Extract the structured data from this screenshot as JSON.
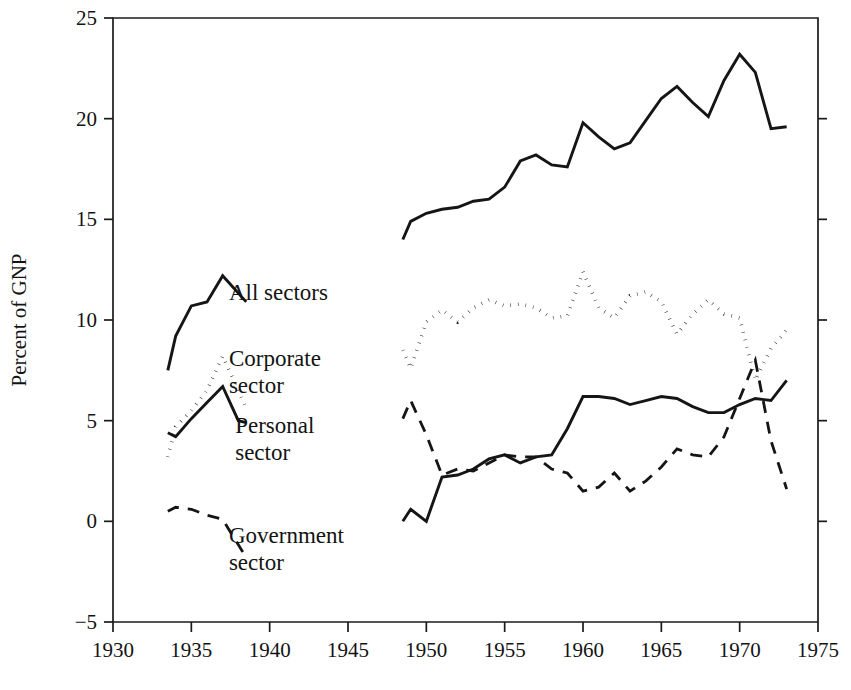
{
  "chart_data": {
    "type": "line",
    "title": "",
    "xlabel": "",
    "ylabel": "Percent of GNP",
    "xlim": [
      1930,
      1975
    ],
    "ylim": [
      -5,
      25
    ],
    "xticks": [
      1930,
      1935,
      1940,
      1945,
      1950,
      1955,
      1960,
      1965,
      1970,
      1975
    ],
    "xtick_labels": [
      "1930",
      "1935",
      "1940",
      "1945",
      "1950",
      "1955",
      "1960",
      "1965",
      "1970",
      "1975"
    ],
    "yticks": [
      -5,
      0,
      5,
      10,
      15,
      20,
      25
    ],
    "ytick_labels": [
      "−5",
      "0",
      "5",
      "10",
      "15",
      "20",
      "25"
    ],
    "grid": false,
    "legend_position": "inline-annotations",
    "series": [
      {
        "name": "All sectors",
        "style": "solid",
        "segments": [
          {
            "period": "prewar",
            "x": [
              1933.5,
              1934,
              1935,
              1936,
              1937,
              1938.5
            ],
            "values": [
              7.5,
              9.2,
              10.7,
              10.9,
              12.2,
              10.9
            ]
          },
          {
            "period": "postwar",
            "x": [
              1948.5,
              1949,
              1950,
              1951,
              1952,
              1953,
              1954,
              1955,
              1956,
              1957,
              1958,
              1959,
              1960,
              1961,
              1962,
              1963,
              1964,
              1965,
              1966,
              1967,
              1968,
              1969,
              1970,
              1971,
              1972,
              1973
            ],
            "values": [
              14.0,
              14.9,
              15.3,
              15.5,
              15.6,
              15.9,
              16.0,
              16.6,
              17.9,
              18.2,
              17.7,
              17.6,
              19.8,
              19.1,
              18.5,
              18.8,
              19.9,
              21.0,
              21.6,
              20.8,
              20.1,
              21.9,
              23.2,
              22.3,
              19.5,
              19.6
            ]
          }
        ]
      },
      {
        "name": "Corporate sector",
        "style": "dotted",
        "segments": [
          {
            "period": "prewar",
            "x": [
              1933.5,
              1934,
              1935,
              1936,
              1937,
              1938,
              1938.5
            ],
            "values": [
              3.2,
              4.7,
              5.5,
              6.5,
              8.2,
              6.5,
              5.6
            ]
          },
          {
            "period": "postwar",
            "x": [
              1948.5,
              1949,
              1950,
              1951,
              1952,
              1953,
              1954,
              1955,
              1956,
              1957,
              1958,
              1959,
              1960,
              1961,
              1962,
              1963,
              1964,
              1965,
              1966,
              1967,
              1968,
              1969,
              1970,
              1971,
              1972,
              1973
            ],
            "values": [
              8.5,
              7.6,
              9.9,
              10.5,
              9.9,
              10.6,
              11.0,
              10.7,
              10.8,
              10.6,
              10.1,
              10.2,
              12.4,
              10.6,
              10.1,
              11.2,
              11.4,
              10.9,
              9.3,
              10.3,
              11.0,
              10.3,
              10.1,
              7.0,
              8.6,
              9.5
            ]
          }
        ]
      },
      {
        "name": "Personal sector",
        "style": "solid",
        "segments": [
          {
            "period": "prewar",
            "x": [
              1933.5,
              1934,
              1935,
              1936,
              1937,
              1938,
              1938.5
            ],
            "values": [
              4.4,
              4.2,
              5.1,
              5.9,
              6.7,
              5.0,
              4.9
            ]
          },
          {
            "period": "postwar",
            "x": [
              1948.5,
              1949,
              1950,
              1951,
              1952,
              1953,
              1954,
              1955,
              1956,
              1957,
              1958,
              1959,
              1960,
              1961,
              1962,
              1963,
              1964,
              1965,
              1966,
              1967,
              1968,
              1969,
              1970,
              1971,
              1972,
              1973
            ],
            "values": [
              0.0,
              0.6,
              0.0,
              2.2,
              2.3,
              2.6,
              3.1,
              3.3,
              2.9,
              3.2,
              3.3,
              4.6,
              6.2,
              6.2,
              6.1,
              5.8,
              6.0,
              6.2,
              6.1,
              5.7,
              5.4,
              5.4,
              5.8,
              6.1,
              6.0,
              7.0
            ]
          }
        ]
      },
      {
        "name": "Government sector",
        "style": "dashed",
        "segments": [
          {
            "period": "prewar",
            "x": [
              1933.5,
              1934,
              1935,
              1936,
              1937,
              1938.5
            ],
            "values": [
              0.5,
              0.7,
              0.6,
              0.3,
              0.1,
              -1.8
            ]
          },
          {
            "period": "postwar",
            "x": [
              1948.5,
              1949,
              1950,
              1951,
              1952,
              1953,
              1954,
              1955,
              1956,
              1957,
              1958,
              1959,
              1960,
              1961,
              1962,
              1963,
              1964,
              1965,
              1966,
              1967,
              1968,
              1969,
              1970,
              1971,
              1972,
              1973
            ],
            "values": [
              5.1,
              6.0,
              4.3,
              2.3,
              2.6,
              2.5,
              2.9,
              3.3,
              3.2,
              3.2,
              2.6,
              2.4,
              1.5,
              1.7,
              2.4,
              1.5,
              2.0,
              2.7,
              3.6,
              3.3,
              3.2,
              4.2,
              6.1,
              8.0,
              4.0,
              1.6
            ]
          }
        ]
      }
    ],
    "annotations": [
      {
        "id": "all-sectors",
        "text": "All sectors",
        "lines": [
          "All sectors"
        ],
        "x": 1937.4,
        "y": 11.4
      },
      {
        "id": "corporate-sector",
        "text": "Corporate sector",
        "lines": [
          "Corporate",
          "sector"
        ],
        "x": 1937.4,
        "y": 8.1
      },
      {
        "id": "personal-sector",
        "text": "Personal sector",
        "lines": [
          "Personal",
          "sector"
        ],
        "x": 1937.8,
        "y": 4.8
      },
      {
        "id": "government-sector",
        "text": "Government sector",
        "lines": [
          "Government",
          "sector"
        ],
        "x": 1937.4,
        "y": -0.7
      }
    ]
  }
}
